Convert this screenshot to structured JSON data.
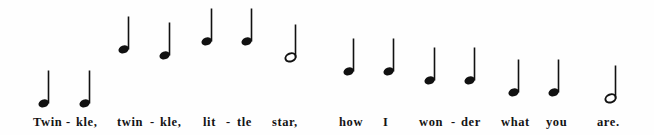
{
  "page": {
    "width": 654,
    "height": 135,
    "background_color": "#fefefe",
    "ink_color": "#141414"
  },
  "score": {
    "type": "melody-contour",
    "note_color": "#111111",
    "stem_direction": "up",
    "notes": [
      {
        "index": 1,
        "syllable": "Twin",
        "glyph": "quarter-note",
        "duration": "quarter",
        "pitch": "C4",
        "x": 44,
        "head_y": 103
      },
      {
        "index": 2,
        "syllable": "kle,",
        "glyph": "quarter-note",
        "duration": "quarter",
        "pitch": "C4",
        "x": 85,
        "head_y": 103
      },
      {
        "index": 3,
        "syllable": "twin",
        "glyph": "quarter-note",
        "duration": "quarter",
        "pitch": "G4",
        "x": 124,
        "head_y": 49
      },
      {
        "index": 4,
        "syllable": "kle,",
        "glyph": "quarter-note",
        "duration": "quarter",
        "pitch": "G4",
        "x": 165,
        "head_y": 55
      },
      {
        "index": 5,
        "syllable": "lit",
        "glyph": "quarter-note",
        "duration": "quarter",
        "pitch": "A4",
        "x": 207,
        "head_y": 41
      },
      {
        "index": 6,
        "syllable": "tle",
        "glyph": "quarter-note",
        "duration": "quarter",
        "pitch": "A4",
        "x": 247,
        "head_y": 41
      },
      {
        "index": 7,
        "syllable": "star,",
        "glyph": "half-note",
        "duration": "half",
        "pitch": "G4",
        "x": 291,
        "head_y": 57
      },
      {
        "index": 8,
        "syllable": "how",
        "glyph": "quarter-note",
        "duration": "quarter",
        "pitch": "F4",
        "x": 349,
        "head_y": 71
      },
      {
        "index": 9,
        "syllable": "I",
        "glyph": "quarter-note",
        "duration": "quarter",
        "pitch": "F4",
        "x": 389,
        "head_y": 71
      },
      {
        "index": 10,
        "syllable": "won",
        "glyph": "quarter-note",
        "duration": "quarter",
        "pitch": "E4",
        "x": 430,
        "head_y": 80
      },
      {
        "index": 11,
        "syllable": "der",
        "glyph": "quarter-note",
        "duration": "quarter",
        "pitch": "E4",
        "x": 470,
        "head_y": 80
      },
      {
        "index": 12,
        "syllable": "what",
        "glyph": "quarter-note",
        "duration": "quarter",
        "pitch": "D4",
        "x": 514,
        "head_y": 92
      },
      {
        "index": 13,
        "syllable": "you",
        "glyph": "quarter-note",
        "duration": "quarter",
        "pitch": "D4",
        "x": 554,
        "head_y": 92
      },
      {
        "index": 14,
        "syllable": "are.",
        "glyph": "half-note",
        "duration": "half",
        "pitch": "C4",
        "x": 611,
        "head_y": 98
      }
    ]
  },
  "lyrics": {
    "full_text": "Twin - kle, twin - kle, lit - tle star, how I won - der what you are.",
    "tokens": [
      {
        "text": "Twin",
        "x": 33
      },
      {
        "text": "-",
        "x": 66
      },
      {
        "text": "kle,",
        "x": 76
      },
      {
        "text": "twin",
        "x": 117
      },
      {
        "text": "-",
        "x": 150
      },
      {
        "text": "kle,",
        "x": 160
      },
      {
        "text": "lit",
        "x": 203
      },
      {
        "text": "-",
        "x": 226
      },
      {
        "text": "tle",
        "x": 237
      },
      {
        "text": "star,",
        "x": 272
      },
      {
        "text": "how",
        "x": 339
      },
      {
        "text": "I",
        "x": 383
      },
      {
        "text": "won",
        "x": 419
      },
      {
        "text": "-",
        "x": 451
      },
      {
        "text": "der",
        "x": 461
      },
      {
        "text": "what",
        "x": 501
      },
      {
        "text": "you",
        "x": 546
      },
      {
        "text": "are.",
        "x": 597
      }
    ]
  },
  "chart_data": {
    "type": "line",
    "xlabel": "Syllable",
    "ylabel": "Pitch",
    "categories": [
      "Twin",
      "kle,",
      "twin",
      "kle,",
      "lit",
      "tle",
      "star,",
      "how",
      "I",
      "won",
      "der",
      "what",
      "you",
      "are."
    ],
    "series": [
      {
        "name": "melody",
        "pitches": [
          "C4",
          "C4",
          "G4",
          "G4",
          "A4",
          "A4",
          "G4",
          "F4",
          "F4",
          "E4",
          "E4",
          "D4",
          "D4",
          "C4"
        ],
        "values": [
          0,
          0,
          4,
          4,
          5,
          5,
          4,
          3,
          3,
          2,
          2,
          1,
          1,
          0
        ],
        "durations": [
          "quarter",
          "quarter",
          "quarter",
          "quarter",
          "quarter",
          "quarter",
          "half",
          "quarter",
          "quarter",
          "quarter",
          "quarter",
          "quarter",
          "quarter",
          "half"
        ]
      }
    ],
    "legend": "none",
    "grid": false
  }
}
